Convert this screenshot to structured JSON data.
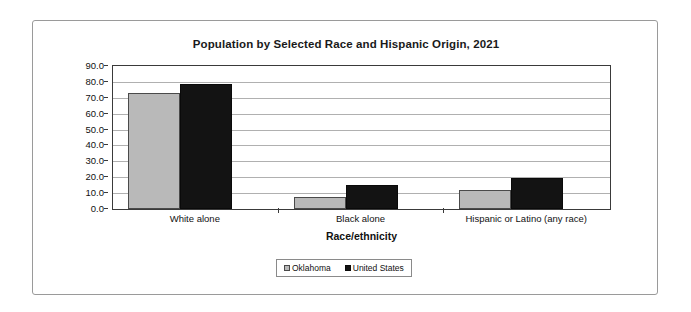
{
  "chart_data": {
    "type": "bar",
    "title": "Population by Selected Race and Hispanic Origin, 2021",
    "xlabel": "Race/ethnicity",
    "ylabel": "Percent",
    "categories": [
      "White alone",
      "Black alone",
      "Hispanic or Latino (any race)"
    ],
    "series": [
      {
        "name": "Oklahoma",
        "values": [
          73.3,
          7.8,
          12.2
        ],
        "color": "#b9b9b9"
      },
      {
        "name": "United States",
        "values": [
          78.8,
          15.0,
          19.5
        ],
        "color": "#131313"
      }
    ],
    "ylim": [
      0.0,
      90.0
    ],
    "ytick_step": 10.0,
    "ytick_labels": [
      "90.0",
      "80.0",
      "70.0",
      "60.0",
      "50.0",
      "40.0",
      "30.0",
      "20.0",
      "10.0",
      "0.0"
    ],
    "grid": true,
    "legend_position": "bottom"
  },
  "legend": {
    "entries": [
      {
        "label": "Oklahoma"
      },
      {
        "label": "United States"
      }
    ]
  }
}
